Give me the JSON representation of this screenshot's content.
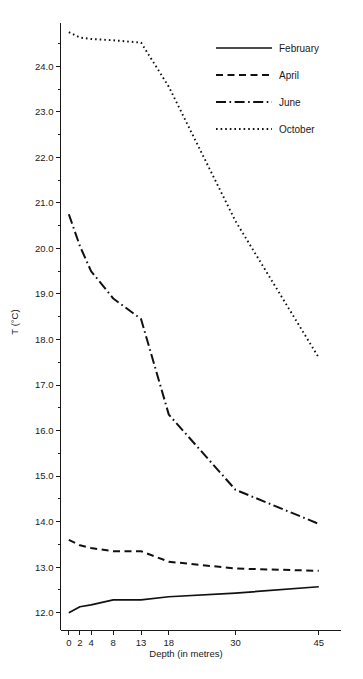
{
  "chart_data": {
    "type": "line",
    "title": "",
    "xlabel": "Depth (in metres)",
    "ylabel": "T (°C)",
    "x": [
      0,
      2,
      4,
      8,
      13,
      18,
      30,
      45
    ],
    "xtick_labels": [
      "0",
      "2",
      "4",
      "8",
      "13",
      "18",
      "30",
      "45"
    ],
    "xlim": [
      -1.5,
      49
    ],
    "ylim": [
      11.62,
      24.95
    ],
    "ytick_labels": [
      "12.0",
      "13.0",
      "14.0",
      "15.0",
      "16.0",
      "17.0",
      "18.0",
      "19.0",
      "20.0",
      "21.0",
      "22.0",
      "23.0",
      "24.0"
    ],
    "ytick_values": [
      12.0,
      13.0,
      14.0,
      15.0,
      16.0,
      17.0,
      18.0,
      19.0,
      20.0,
      21.0,
      22.0,
      23.0,
      24.0
    ],
    "yminor_values": [
      12.5,
      13.5,
      14.5,
      15.5,
      16.5,
      17.5,
      18.5,
      19.5,
      20.5,
      21.5,
      22.5,
      23.5,
      24.5
    ],
    "grid": false,
    "legend_position": "upper right",
    "series": [
      {
        "name": "February",
        "style": "solid",
        "values": [
          12.0,
          12.13,
          12.17,
          12.28,
          12.28,
          12.35,
          12.43,
          12.57
        ]
      },
      {
        "name": "April",
        "style": "dashed",
        "values": [
          13.6,
          13.48,
          13.42,
          13.35,
          13.35,
          13.12,
          12.97,
          12.92
        ]
      },
      {
        "name": "June",
        "style": "dashdot",
        "values": [
          20.75,
          20.05,
          19.5,
          18.9,
          18.45,
          16.35,
          14.7,
          13.95
        ]
      },
      {
        "name": "October",
        "style": "dotted",
        "values": [
          24.75,
          24.63,
          24.6,
          24.57,
          24.52,
          23.55,
          20.6,
          17.6
        ]
      }
    ]
  },
  "legend": {
    "items": [
      {
        "label": "February"
      },
      {
        "label": "April"
      },
      {
        "label": "June"
      },
      {
        "label": "October"
      }
    ]
  }
}
